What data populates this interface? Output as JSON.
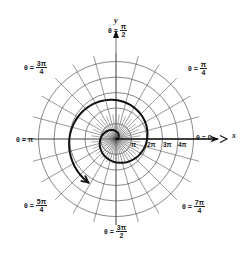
{
  "figure": {
    "center": {
      "x": 116,
      "y": 139
    },
    "ring_spacing_px": 15.5,
    "ring_count": 5,
    "radial_line_extent_px": 86,
    "radial_step_deg": 15,
    "colors": {
      "grid": "#555555",
      "spiral": "#111111",
      "axis": "#111111",
      "background": "#ffffff"
    }
  },
  "axes": {
    "x_label": "x",
    "y_label": "y"
  },
  "angle_labels": [
    {
      "id": "theta-0",
      "prefix": "θ =",
      "num": "0",
      "den": "",
      "x": 196,
      "y": 134
    },
    {
      "id": "theta-pi-4",
      "prefix": "θ =",
      "num": "π",
      "den": "4",
      "x": 188,
      "y": 65
    },
    {
      "id": "theta-pi-2",
      "prefix": "θ =",
      "num": "π",
      "den": "2",
      "x": 108,
      "y": 27
    },
    {
      "id": "theta-3pi-4",
      "prefix": "θ =",
      "num": "3π",
      "den": "4",
      "x": 24,
      "y": 64
    },
    {
      "id": "theta-pi",
      "prefix": "θ =",
      "num": "π",
      "den": "",
      "x": 16,
      "y": 136
    },
    {
      "id": "theta-5pi-4",
      "prefix": "θ =",
      "num": "5π",
      "den": "4",
      "x": 24,
      "y": 202
    },
    {
      "id": "theta-3pi-2",
      "prefix": "θ =",
      "num": "3π",
      "den": "2",
      "x": 104,
      "y": 228
    },
    {
      "id": "theta-7pi-4",
      "prefix": "θ =",
      "num": "7π",
      "den": "4",
      "x": 182,
      "y": 203
    }
  ],
  "radius_ticks": [
    {
      "label": "π",
      "x": 131,
      "y": 141
    },
    {
      "label": "2π",
      "x": 147,
      "y": 141
    },
    {
      "label": "3π",
      "x": 163,
      "y": 141
    },
    {
      "label": "4π",
      "x": 178,
      "y": 141
    }
  ],
  "spiral": {
    "equation": "r = θ",
    "scale_px_per_rad": 4.95,
    "theta_start": 0,
    "theta_end_over_pi": 3.32
  }
}
